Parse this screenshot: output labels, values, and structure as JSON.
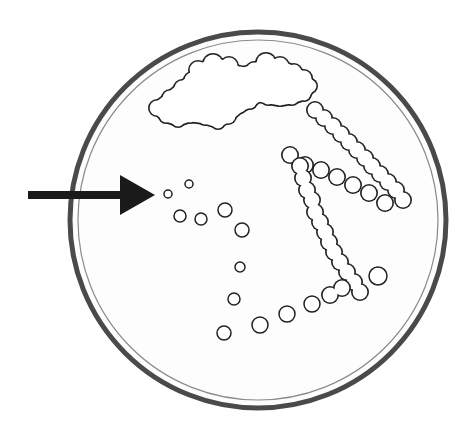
{
  "diagram": {
    "type": "streak-plate-isolation",
    "colors": {
      "background": "#ffffff",
      "dish_outer": "#4a4a4a",
      "dish_inner": "#8a8a8a",
      "colony_stroke": "#222222",
      "arrow": "#1a1a1a"
    },
    "dish": {
      "cx": 258,
      "cy": 220,
      "r_outer": 188,
      "r_inner": 180
    },
    "arrow": {
      "x1": 28,
      "y1": 195,
      "x2": 155,
      "y2": 195,
      "points_to": "isolated-colonies"
    },
    "cloud_mass": {
      "bumps": [
        [
          157,
          108,
          9
        ],
        [
          170,
          98,
          9
        ],
        [
          182,
          88,
          9
        ],
        [
          192,
          80,
          9
        ],
        [
          198,
          70,
          10
        ],
        [
          213,
          64,
          11
        ],
        [
          229,
          66,
          10
        ],
        [
          240,
          74,
          9
        ],
        [
          254,
          70,
          9
        ],
        [
          266,
          63,
          11
        ],
        [
          280,
          66,
          10
        ],
        [
          294,
          72,
          9
        ],
        [
          304,
          78,
          9
        ],
        [
          310,
          86,
          8
        ],
        [
          304,
          94,
          8
        ],
        [
          292,
          98,
          8
        ],
        [
          280,
          100,
          7
        ],
        [
          268,
          98,
          8
        ],
        [
          258,
          96,
          7
        ],
        [
          250,
          102,
          8
        ],
        [
          240,
          106,
          8
        ],
        [
          228,
          116,
          9
        ],
        [
          218,
          122,
          8
        ],
        [
          205,
          118,
          8
        ],
        [
          190,
          116,
          8
        ],
        [
          178,
          120,
          8
        ],
        [
          166,
          116,
          8
        ]
      ]
    },
    "streak_chains": [
      {
        "name": "chain-upper-diagonal",
        "r": 9,
        "points": [
          [
            315,
            110
          ],
          [
            324,
            118
          ],
          [
            333,
            126
          ],
          [
            341,
            134
          ],
          [
            349,
            142
          ],
          [
            357,
            150
          ],
          [
            365,
            158
          ],
          [
            372,
            166
          ],
          [
            380,
            174
          ],
          [
            388,
            182
          ],
          [
            396,
            190
          ],
          [
            403,
            200
          ]
        ]
      },
      {
        "name": "chain-middle-diagonal",
        "r": 9,
        "points": [
          [
            290,
            155
          ],
          [
            305,
            165
          ],
          [
            321,
            170
          ],
          [
            337,
            177
          ],
          [
            353,
            185
          ],
          [
            369,
            193
          ],
          [
            385,
            203
          ]
        ]
      },
      {
        "name": "chain-vertical",
        "r": 9,
        "points": [
          [
            300,
            166
          ],
          [
            303,
            178
          ],
          [
            307,
            190
          ],
          [
            312,
            200
          ],
          [
            315,
            212
          ],
          [
            320,
            222
          ],
          [
            325,
            232
          ],
          [
            329,
            242
          ],
          [
            334,
            252
          ],
          [
            340,
            262
          ],
          [
            347,
            272
          ],
          [
            354,
            282
          ],
          [
            360,
            292
          ]
        ]
      },
      {
        "name": "chain-bottom-join",
        "r": 9,
        "points": [
          [
            330,
            295
          ],
          [
            342,
            288
          ]
        ]
      }
    ],
    "isolated_colonies": [
      {
        "x": 168,
        "y": 194,
        "r": 4
      },
      {
        "x": 189,
        "y": 184,
        "r": 4
      },
      {
        "x": 180,
        "y": 216,
        "r": 6
      },
      {
        "x": 201,
        "y": 219,
        "r": 6
      },
      {
        "x": 225,
        "y": 210,
        "r": 7
      },
      {
        "x": 242,
        "y": 230,
        "r": 7
      },
      {
        "x": 240,
        "y": 267,
        "r": 5
      },
      {
        "x": 234,
        "y": 299,
        "r": 6
      },
      {
        "x": 224,
        "y": 333,
        "r": 7
      },
      {
        "x": 260,
        "y": 325,
        "r": 8
      },
      {
        "x": 287,
        "y": 314,
        "r": 8
      },
      {
        "x": 312,
        "y": 304,
        "r": 8
      },
      {
        "x": 378,
        "y": 276,
        "r": 9
      }
    ]
  }
}
